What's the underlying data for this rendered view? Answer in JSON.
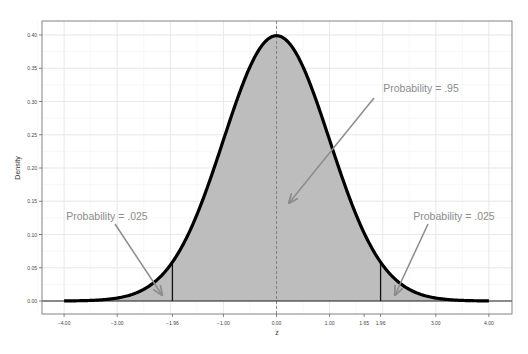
{
  "chart_data": {
    "type": "area",
    "title": "",
    "xlabel": "z",
    "ylabel": "Density",
    "xlim": [
      -4.5,
      4.5
    ],
    "ylim": [
      -0.015,
      0.42
    ],
    "grid": true,
    "x_ticks": [
      -4,
      -3,
      -1.96,
      -1,
      0,
      1,
      1.65,
      1.96,
      3,
      4
    ],
    "x_tick_labels": [
      "−4.00",
      "−3.00",
      "−1.96",
      "−1.00",
      "0.00",
      "1.00",
      "1.65",
      "1.96",
      "3.00",
      "4.00"
    ],
    "y_ticks": [
      0,
      0.05,
      0.1,
      0.15,
      0.2,
      0.25,
      0.3,
      0.35,
      0.4
    ],
    "y_tick_labels": [
      "0.00",
      "0.05",
      "0.10",
      "0.15",
      "0.20",
      "0.25",
      "0.30",
      "0.35",
      "0.40"
    ],
    "series": [
      {
        "name": "Standard normal density",
        "distribution": "normal",
        "mean": 0,
        "sd": 1,
        "x_range": [
          -4,
          4
        ],
        "peak": 0.399
      }
    ],
    "shaded_regions": [
      {
        "from": -4,
        "to": -1.96,
        "label": "Probability = .025"
      },
      {
        "from": -1.96,
        "to": 1.96,
        "label": "Probability = .95"
      },
      {
        "from": 1.96,
        "to": 4,
        "label": "Probability = .025"
      }
    ],
    "reference_lines": [
      {
        "x": 0,
        "style": "dashed"
      },
      {
        "x": -1.96,
        "style": "solid"
      },
      {
        "x": 1.96,
        "style": "solid"
      },
      {
        "y": 0,
        "style": "solid"
      }
    ],
    "annotations": [
      {
        "text": "Probability = .95",
        "text_pos": [
          1.9,
          0.31
        ],
        "arrow_to": [
          0.15,
          0.145
        ]
      },
      {
        "text": "Probability = .025",
        "text_pos": [
          -2.55,
          0.12
        ],
        "arrow_to": [
          -2.3,
          0.012
        ]
      },
      {
        "text": "Probability = .025",
        "text_pos": [
          2.85,
          0.12
        ],
        "arrow_to": [
          2.3,
          0.012
        ]
      }
    ]
  },
  "colors": {
    "curve": "#000000",
    "fill": "#bdbdbd",
    "grid": "#e6e6e6",
    "annotation": "#8c8c8c",
    "axis": "#555555"
  }
}
